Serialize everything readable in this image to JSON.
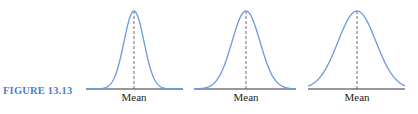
{
  "figure": {
    "label": "FIGURE 13.13",
    "accent_color": "#4a7fc4",
    "curve_color": "#6a9ae0"
  },
  "chart_data": {
    "type": "line",
    "title": "",
    "panels": [
      {
        "xlabel": "Mean",
        "relative_spread": "small",
        "sigma": 1.0
      },
      {
        "xlabel": "Mean",
        "relative_spread": "medium",
        "sigma": 1.4
      },
      {
        "xlabel": "Mean",
        "relative_spread": "large",
        "sigma": 1.9
      }
    ],
    "grid": false,
    "legend": false
  }
}
